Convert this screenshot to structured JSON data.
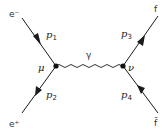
{
  "diagram": {
    "type": "feynman",
    "particles": {
      "incoming_electron": "e⁻",
      "incoming_positron": "e⁺",
      "outgoing_fermion": "f",
      "outgoing_antifermion": "f̄",
      "propagator": "γ"
    },
    "momenta": {
      "p1": {
        "base": "p",
        "sub": "1"
      },
      "p2": {
        "base": "p",
        "sub": "2"
      },
      "p3": {
        "base": "p",
        "sub": "3"
      },
      "p4": {
        "base": "p",
        "sub": "4"
      }
    },
    "vertices": {
      "left": "μ",
      "right": "ν"
    },
    "colors": {
      "line": "#1a1a1a",
      "text": "#333333",
      "background": "#ffffff"
    }
  }
}
